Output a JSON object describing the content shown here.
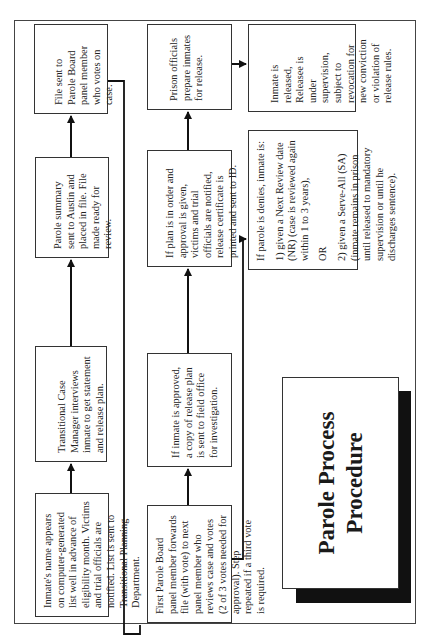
{
  "title": {
    "line1": "Parole Process",
    "line2": "Procedure"
  },
  "steps": {
    "eligibility_list": "Inmate's name appears on computer-generated list well in advance of eligibility month.  Victims and trial officials are notified.  List is sent to Transitional Planning Department.",
    "case_manager": "Transitional Case Manager interviews inmate to get statement and release plan.",
    "parole_summary": "Parole summary sent to Austin and placed in file.  File made ready for review.",
    "file_sent": "File sent to Parole Board panel member who votes on case.",
    "first_panel": "First Parole Board panel member forwards file (with vote) to next panel member who reviews case and votes (2 of 3 votes needed for approval).  Step repeated if a third vote is required.",
    "approved_copy": "If inmate is approved, a copy of release plan is sent to field office for investigation.",
    "plan_in_order": "If plan is in order and approval is given, victims and trial officials are notified, release certificate is printed and sent to ID.",
    "prison_officials": "Prison officials prepare inmates for release.",
    "released": "Inmate is released, Releasee is under supervision, subject to revocation for new conviction or violation of release rules.",
    "denied": {
      "intro": "If parole is denies, inmate is:",
      "option1": "1) given a Next Review date (NR) (case is reviewed again within 1 to 3 years),",
      "or": "OR",
      "option2": "2) given a Serve-All (SA) (inmate remains in prison until released to mandatory supervision or until he discharges sentence)."
    }
  }
}
